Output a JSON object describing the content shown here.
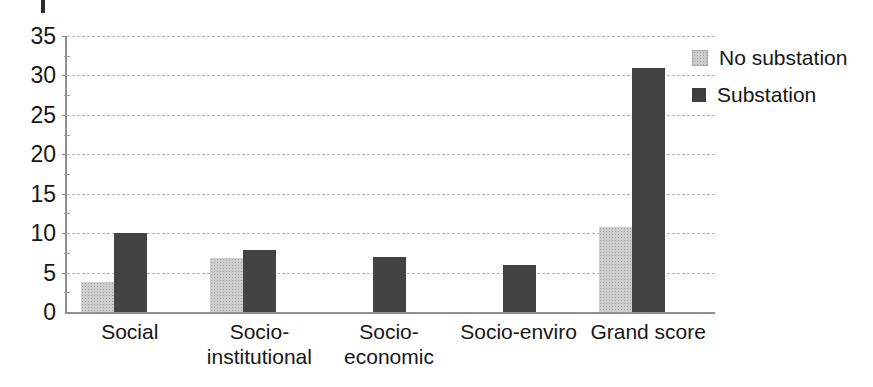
{
  "chart_data": {
    "type": "bar",
    "title": "",
    "xlabel": "",
    "ylabel": "",
    "categories": [
      "Social",
      "Socio-\ninstitutional",
      "Socio-\neconomic",
      "Socio-enviro",
      "Grand score"
    ],
    "series": [
      {
        "name": "No substation",
        "values": [
          3.8,
          6.8,
          0,
          0,
          10.8
        ],
        "color": "#cdcdcd",
        "texture": "stipple"
      },
      {
        "name": "Substation",
        "values": [
          10,
          7.9,
          7,
          6,
          31
        ],
        "color": "#434343",
        "texture": "solid"
      }
    ],
    "ylim": [
      0,
      35
    ],
    "yticks": [
      0,
      5,
      10,
      15,
      20,
      25,
      30,
      35
    ],
    "minor_tick_interval": 2.5,
    "grid": true,
    "grid_style": "dashed",
    "legend_position": "right-top",
    "colors": {
      "axis": "#8f8f8f",
      "grid": "#b7b7b7",
      "text": "#161616"
    }
  }
}
